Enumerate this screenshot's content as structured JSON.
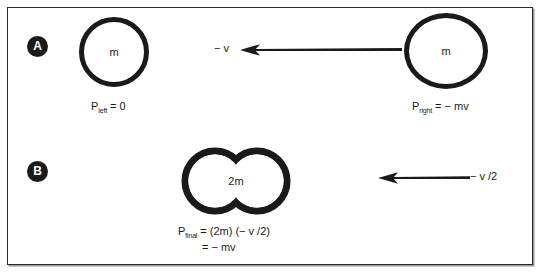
{
  "figure": {
    "type": "physics-momentum-diagram",
    "background": "#ffffff",
    "ink_color": "#1a1a1a"
  },
  "panels": [
    {
      "badge": "A",
      "left_object": {
        "mass_label": "m",
        "momentum_label": "P",
        "momentum_sub": "left",
        "momentum_value": "= 0"
      },
      "right_object": {
        "mass_label": "m",
        "momentum_label": "P",
        "momentum_sub": "right",
        "momentum_value": "= − mv"
      },
      "arrow": {
        "direction": "left",
        "velocity_label": "− v"
      }
    },
    {
      "badge": "B",
      "merged_object": {
        "mass_label": "2m"
      },
      "arrow": {
        "direction": "left",
        "velocity_label": "− v /2"
      },
      "formula": {
        "symbol": "P",
        "sub": "final",
        "line1": "= (2m) (− v /2)",
        "line2": "= − mv"
      }
    }
  ]
}
